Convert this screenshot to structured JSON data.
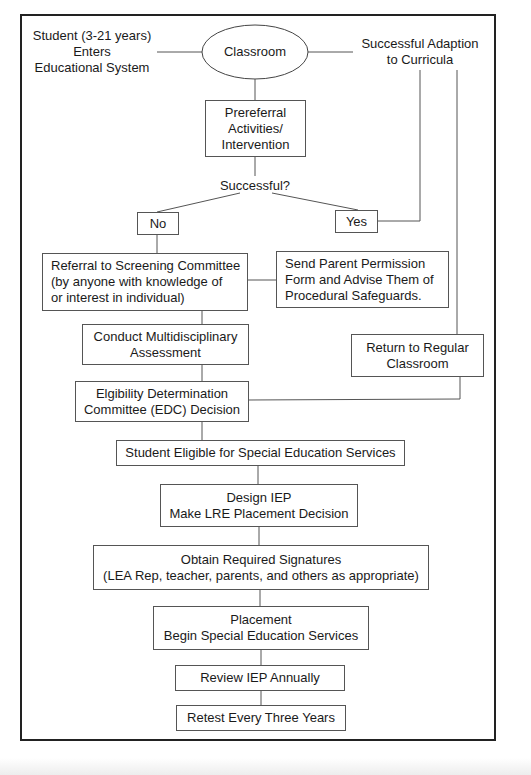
{
  "diagram": {
    "type": "flowchart",
    "entry_label": "Student (3-21 years)\nEnters\nEducational System",
    "success_label": "Successful Adaption\nto Curricula",
    "nodes": {
      "classroom": "Classroom",
      "prereferral": "Prereferral\nActivities/\nIntervention",
      "decision": "Successful?",
      "no": "No",
      "yes": "Yes",
      "referral": "Referral to Screening Committee\n(by anyone with knowledge of\nor interest in individual)",
      "parent_permission": "Send Parent Permission\nForm and Advise Them of\nProcedural Safeguards.",
      "assessment": "Conduct Multidisciplinary\nAssessment",
      "return_classroom": "Return to Regular\nClassroom",
      "edc": "Elgibility Determination\nCommittee (EDC) Decision",
      "eligible": "Student Eligible for Special Education Services",
      "design_iep": "Design IEP\nMake LRE Placement Decision",
      "signatures": "Obtain Required Signatures\n(LEA Rep, teacher, parents, and others as appropriate)",
      "placement": "Placement\nBegin Special Education Services",
      "review": "Review IEP Annually",
      "retest": "Retest Every Three Years"
    },
    "edges": [
      [
        "entry_label",
        "classroom"
      ],
      [
        "classroom",
        "success_label"
      ],
      [
        "classroom",
        "prereferral"
      ],
      [
        "prereferral",
        "decision"
      ],
      [
        "decision",
        "no"
      ],
      [
        "decision",
        "yes"
      ],
      [
        "yes",
        "success_label"
      ],
      [
        "no",
        "referral"
      ],
      [
        "referral",
        "parent_permission"
      ],
      [
        "referral",
        "assessment"
      ],
      [
        "assessment",
        "edc"
      ],
      [
        "success_label",
        "return_classroom"
      ],
      [
        "edc",
        "return_classroom"
      ],
      [
        "edc",
        "eligible"
      ],
      [
        "eligible",
        "design_iep"
      ],
      [
        "design_iep",
        "signatures"
      ],
      [
        "signatures",
        "placement"
      ],
      [
        "placement",
        "review"
      ],
      [
        "review",
        "retest"
      ]
    ]
  }
}
